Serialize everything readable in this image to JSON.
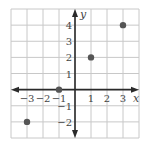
{
  "chart_data": {
    "type": "scatter",
    "title": "",
    "xlabel": "x",
    "ylabel": "y",
    "xlim": [
      -4,
      4
    ],
    "ylim": [
      -3,
      5
    ],
    "grid": true,
    "legend": null,
    "x_ticks": [
      -3,
      -2,
      -1,
      1,
      2,
      3
    ],
    "x_tick_labels": [
      "−3",
      "−2",
      "−1",
      "1",
      "2",
      "3"
    ],
    "y_ticks": [
      -2,
      -1,
      1,
      2,
      3,
      4
    ],
    "y_tick_labels": [
      "−2",
      "−1",
      "1",
      "2",
      "3",
      "4"
    ],
    "series": [
      {
        "name": "points",
        "points": [
          {
            "x": -3,
            "y": -2
          },
          {
            "x": -1,
            "y": 0
          },
          {
            "x": 1,
            "y": 2
          },
          {
            "x": 3,
            "y": 4
          }
        ]
      }
    ]
  },
  "colors": {
    "grid": "#c8c8c8",
    "axis": "#2a2a2a",
    "point": "#555555",
    "text": "#444444"
  }
}
